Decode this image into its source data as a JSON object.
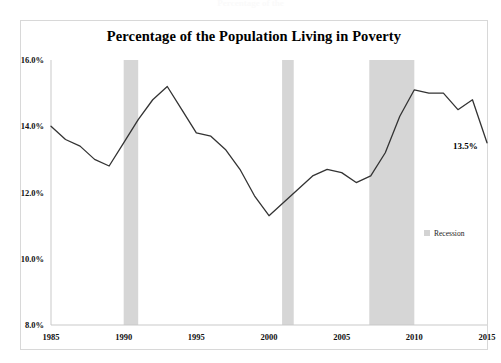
{
  "page": {
    "top_ghost_text": "Percentage of the"
  },
  "chart_data": {
    "type": "line",
    "title": "Percentage of the Population Living in Poverty",
    "xlabel": "",
    "ylabel": "",
    "xlim": [
      1985,
      2015
    ],
    "ylim": [
      8.0,
      16.0
    ],
    "grid": false,
    "legend_position": "right-middle",
    "y_ticks": [
      "8.0%",
      "10.0%",
      "12.0%",
      "14.0%",
      "16.0%"
    ],
    "y_tick_values": [
      8.0,
      10.0,
      12.0,
      14.0,
      16.0
    ],
    "x_ticks": [
      "1985",
      "1990",
      "1995",
      "2000",
      "2005",
      "2010",
      "2015"
    ],
    "x_tick_values": [
      1985,
      1990,
      1995,
      2000,
      2005,
      2010,
      2015
    ],
    "series": [
      {
        "name": "Poverty rate",
        "color": "#333333",
        "x": [
          1985,
          1986,
          1987,
          1988,
          1989,
          1990,
          1991,
          1992,
          1993,
          1994,
          1995,
          1996,
          1997,
          1998,
          1999,
          2000,
          2001,
          2002,
          2003,
          2004,
          2005,
          2006,
          2007,
          2008,
          2009,
          2010,
          2011,
          2012,
          2013,
          2014,
          2015
        ],
        "values": [
          14.0,
          13.6,
          13.4,
          13.0,
          12.8,
          13.5,
          14.2,
          14.8,
          15.2,
          14.5,
          13.8,
          13.7,
          13.3,
          12.7,
          11.9,
          11.3,
          11.7,
          12.1,
          12.5,
          12.7,
          12.6,
          12.3,
          12.5,
          13.2,
          14.3,
          15.1,
          15.0,
          15.0,
          14.5,
          14.8,
          13.5
        ]
      }
    ],
    "annotations": [
      {
        "label": "13.5%",
        "x": 2015,
        "y": 13.5
      }
    ],
    "legend": [
      {
        "label": "Recession",
        "color": "#d3d3d3",
        "marker": "square"
      }
    ],
    "shaded_bands": [
      {
        "name": "recession-1990",
        "start": 1990.0,
        "end": 1991.0
      },
      {
        "name": "recession-2001",
        "start": 2000.9,
        "end": 2001.7
      },
      {
        "name": "recession-2008",
        "start": 2006.9,
        "end": 2010.0
      }
    ]
  }
}
